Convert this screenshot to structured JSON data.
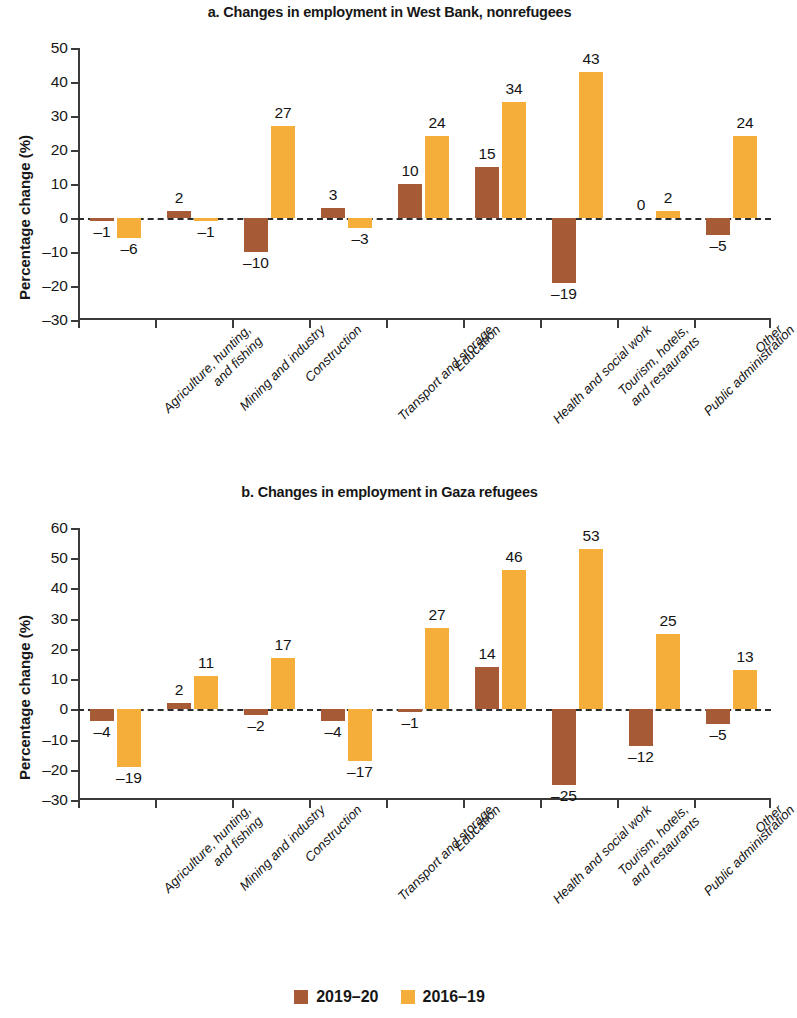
{
  "figure": {
    "width": 779,
    "height": 1018,
    "colors": {
      "series_2019_20": "#a65a36",
      "series_2016_19": "#f5ae39",
      "axis": "#3b3b3b",
      "text": "#171717",
      "background": "#ffffff"
    }
  },
  "legend": {
    "position": "bottom-center",
    "items": [
      {
        "label": "2019–20",
        "color": "#a65a36",
        "swatch": "square-swatch"
      },
      {
        "label": "2016–19",
        "color": "#f5ae39",
        "swatch": "square-swatch"
      }
    ]
  },
  "categories": [
    "Agriculture, hunting,\nand fishing",
    "Mining and industry",
    "Construction",
    "Transport and storage",
    "Education",
    "Health and social work",
    "Tourism, hotels,\nand restaurants",
    "Public administration",
    "Other"
  ],
  "chart_data": [
    {
      "type": "bar",
      "panel": "a",
      "title": "a. Changes in employment in West Bank, nonrefugees",
      "xlabel": "",
      "ylabel": "Percentage change (%)",
      "ylim": [
        -30,
        50
      ],
      "ytick_step": 10,
      "yticks": [
        50,
        40,
        30,
        20,
        10,
        0,
        -10,
        -20,
        -30
      ],
      "ytick_labels": [
        "50",
        "40",
        "30",
        "20",
        "10",
        "0",
        "–10",
        "–20",
        "–30"
      ],
      "grid": false,
      "zero_line": true,
      "legend_position": "bottom-center",
      "categories": [
        "Agriculture, hunting, and fishing",
        "Mining and industry",
        "Construction",
        "Transport and storage",
        "Education",
        "Health and social work",
        "Tourism, hotels, and restaurants",
        "Public administration",
        "Other"
      ],
      "series": [
        {
          "name": "2019–20",
          "color": "#a65a36",
          "values": [
            -1,
            2,
            -10,
            3,
            10,
            15,
            -19,
            0,
            -5
          ],
          "labels": [
            "–1",
            "2",
            "–10",
            "3",
            "10",
            "15",
            "–19",
            "0",
            "–5"
          ]
        },
        {
          "name": "2016–19",
          "color": "#f5ae39",
          "values": [
            -6,
            -1,
            27,
            -3,
            24,
            34,
            43,
            2,
            24
          ],
          "labels": [
            "–6",
            "–1",
            "27",
            "–3",
            "24",
            "34",
            "43",
            "2",
            "24"
          ]
        }
      ]
    },
    {
      "type": "bar",
      "panel": "b",
      "title": "b. Changes in employment in Gaza refugees",
      "xlabel": "",
      "ylabel": "Percentage change (%)",
      "ylim": [
        -30,
        60
      ],
      "ytick_step": 10,
      "yticks": [
        60,
        50,
        40,
        30,
        20,
        10,
        0,
        -10,
        -20,
        -30
      ],
      "ytick_labels": [
        "60",
        "50",
        "40",
        "30",
        "20",
        "10",
        "0",
        "–10",
        "–20",
        "–30"
      ],
      "grid": false,
      "zero_line": true,
      "legend_position": "bottom-center",
      "categories": [
        "Agriculture, hunting, and fishing",
        "Mining and industry",
        "Construction",
        "Transport and storage",
        "Education",
        "Health and social work",
        "Tourism, hotels, and restaurants",
        "Public administration",
        "Other"
      ],
      "series": [
        {
          "name": "2019–20",
          "color": "#a65a36",
          "values": [
            -4,
            2,
            -2,
            -4,
            -1,
            14,
            -25,
            -12,
            -5
          ],
          "labels": [
            "–4",
            "2",
            "–2",
            "–4",
            "–1",
            "14",
            "–25",
            "–12",
            "–5"
          ]
        },
        {
          "name": "2016–19",
          "color": "#f5ae39",
          "values": [
            -19,
            11,
            17,
            -17,
            27,
            46,
            53,
            25,
            13
          ],
          "labels": [
            "–19",
            "11",
            "17",
            "–17",
            "27",
            "46",
            "53",
            "25",
            "13"
          ]
        }
      ]
    }
  ]
}
